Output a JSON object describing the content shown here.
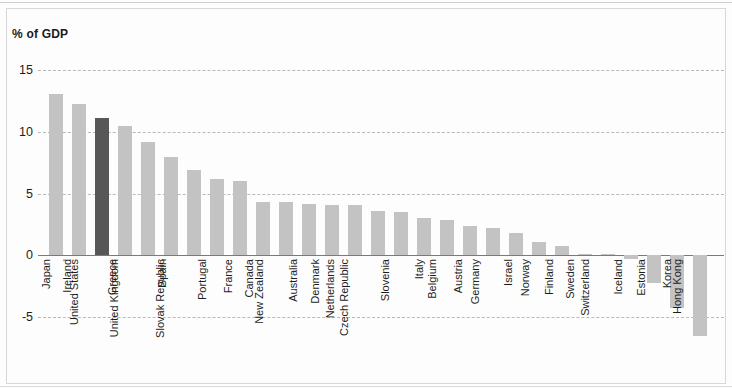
{
  "chart_data": {
    "type": "bar",
    "title": "",
    "ylabel": "% of GDP",
    "xlabel": "",
    "ylim": [
      -7.5,
      15.5
    ],
    "yticks": [
      15,
      10,
      5,
      0,
      -5
    ],
    "ytick_labels": [
      "15",
      "10",
      "5",
      "0",
      "-5"
    ],
    "grid": true,
    "legend": "none",
    "orientation": "vertical",
    "highlight_category": "United States",
    "colors": {
      "bar": "#c3c3c3",
      "bar_highlight": "#575757",
      "gridline": "#b9b9b9",
      "zeroline": "#7a7a7a",
      "text": "#1d1d1d",
      "frame": "#d8d8d8",
      "background": "#fdfdfd"
    },
    "categories": [
      "Japan",
      "Ireland",
      "United States",
      "Greece",
      "United Kingdom",
      "Spain",
      "Slovak Republic",
      "Portugal",
      "France",
      "Canada",
      "New Zealand",
      "Australia",
      "Denmark",
      "Netherlands",
      "Czech Republic",
      "Slovenia",
      "Italy",
      "Belgium",
      "Austria",
      "Germany",
      "Israel",
      "Norway",
      "Finland",
      "Sweden",
      "Switzerland",
      "Iceland",
      "Estonia",
      "Korea",
      "Hong Kong"
    ],
    "values": [
      13.1,
      12.3,
      11.1,
      10.5,
      9.2,
      8.0,
      6.9,
      6.2,
      6.0,
      4.3,
      4.3,
      4.2,
      4.1,
      4.1,
      3.6,
      3.5,
      3.0,
      2.9,
      2.4,
      2.2,
      1.8,
      1.1,
      0.8,
      0.15,
      0.1,
      -0.3,
      -2.2,
      -4.3,
      -6.5
    ]
  }
}
